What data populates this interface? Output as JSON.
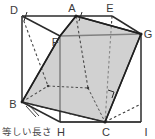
{
  "figure": {
    "shape": "cube",
    "caption": "等しい長さ",
    "colors": {
      "stroke": "#2b2b2b",
      "hidden_stroke": "#3a3a3a",
      "cut_fill": "#b4b4b4",
      "label": "#3a3a3a",
      "background": "#ffffff"
    },
    "vertices": [
      {
        "id": "D",
        "label": "D",
        "x": 22,
        "y": 16,
        "lx": 16,
        "ly": 14,
        "visible": true
      },
      {
        "id": "A",
        "label": "A",
        "x": 76,
        "y": 16,
        "lx": 72,
        "ly": 13,
        "visible": true
      },
      {
        "id": "E",
        "label": "E",
        "x": 112,
        "y": 16,
        "lx": 107,
        "ly": 13,
        "visible": true
      },
      {
        "id": "G",
        "label": "G",
        "x": 141,
        "y": 34,
        "lx": 143,
        "ly": 35,
        "visible": true
      },
      {
        "id": "F",
        "label": "F",
        "x": 60,
        "y": 36,
        "lx": 53,
        "ly": 43,
        "visible": true
      },
      {
        "id": "B",
        "label": "B",
        "x": 22,
        "y": 102,
        "lx": 14,
        "ly": 107,
        "visible": true
      },
      {
        "id": "H",
        "label": "H",
        "x": 60,
        "y": 122,
        "lx": 56,
        "ly": 134,
        "visible": true
      },
      {
        "id": "C",
        "label": "C",
        "x": 105,
        "y": 122,
        "lx": 101,
        "ly": 134,
        "visible": true
      },
      {
        "id": "I",
        "label": "I",
        "x": 141,
        "y": 104,
        "lx": 143,
        "ly": 134,
        "visible": true
      }
    ],
    "edges_solid": [
      {
        "from": "D",
        "to": "A"
      },
      {
        "from": "A",
        "to": "E"
      },
      {
        "from": "E",
        "to": "G"
      },
      {
        "from": "D",
        "to": "B"
      },
      {
        "from": "B",
        "to": "H"
      },
      {
        "from": "H",
        "to": "C"
      },
      {
        "from": "C",
        "to": "I"
      },
      {
        "from": "G",
        "to": "I"
      },
      {
        "from": "H",
        "to": "F"
      }
    ],
    "edges_hidden": [
      {
        "from": "E",
        "to": "C"
      },
      {
        "from": "B",
        "to": "C"
      },
      {
        "from": "C",
        "to": "G"
      }
    ],
    "cut_polygon": [
      "A",
      "G",
      "C",
      "B",
      "F"
    ],
    "cut_edges": [
      {
        "from": "A",
        "to": "F"
      },
      {
        "from": "A",
        "to": "G"
      },
      {
        "from": "F",
        "to": "B"
      },
      {
        "from": "B",
        "to": "C"
      },
      {
        "from": "C",
        "to": "G"
      }
    ],
    "interior_dashed": [
      {
        "from": "D",
        "to": "M1"
      },
      {
        "from": "B",
        "to": "M1"
      },
      {
        "from": "A",
        "to": "M2"
      },
      {
        "from": "E",
        "to": "M2"
      },
      {
        "from": "M1",
        "to": "M2"
      }
    ],
    "interior_points": [
      {
        "id": "M1",
        "x": 48,
        "y": 86
      },
      {
        "id": "M2",
        "x": 88,
        "y": 88
      }
    ],
    "tick_marks": [
      {
        "id": "tick-DA",
        "x": 26,
        "y": 21,
        "angle": -55
      },
      {
        "id": "tick-AE",
        "x": 81,
        "y": 22,
        "angle": -55
      },
      {
        "id": "tick-BH-1",
        "x": 30,
        "y": 110,
        "angle": -55
      },
      {
        "id": "tick-BH-2",
        "x": 35,
        "y": 112,
        "angle": -55
      }
    ],
    "right_angle": {
      "id": "right-angle-mark",
      "x": 110,
      "y": 93
    },
    "caption_position": {
      "x": 2,
      "y": 133
    }
  }
}
